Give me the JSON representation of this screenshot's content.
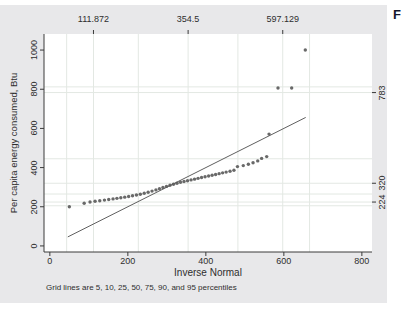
{
  "page": {
    "corner_text": "F"
  },
  "colors": {
    "background": "#e8e8ea",
    "plot_background": "#ffffff",
    "point": "#595959",
    "reference_line": "#5f5f5f",
    "grid": "#e3e8e3",
    "axis": "#3a3a3a",
    "text": "#2e2e2e"
  },
  "chart_data": {
    "type": "scatter",
    "title": "",
    "xlabel": "Inverse Normal",
    "ylabel": "Per capita energy consumed, Btu",
    "note": "Grid lines are 5, 10, 25, 50, 75, 90, and 95 percentiles",
    "xlim": [
      -15,
      826
    ],
    "ylim": [
      -31,
      1082
    ],
    "x_ticks": [
      0,
      200,
      400,
      600,
      800
    ],
    "y_ticks": [
      0,
      200,
      400,
      600,
      800,
      1000
    ],
    "top_axis_labels": [
      {
        "value": 111.872,
        "label": "111.872"
      },
      {
        "value": 354.5,
        "label": "354.5"
      },
      {
        "value": 597.129,
        "label": "597.129"
      }
    ],
    "right_axis_labels": [
      {
        "value": 783,
        "label": "783"
      },
      {
        "value": 320,
        "label": "320"
      },
      {
        "value": 224,
        "label": "224"
      }
    ],
    "grid_x_values": [
      43.1,
      111.872,
      226.8,
      354.5,
      482.2,
      597.129,
      665.9
    ],
    "grid_y_values": [
      205,
      224,
      265,
      320,
      445,
      783,
      812
    ],
    "reference_line": {
      "x1": 46,
      "y1": 46,
      "x2": 656,
      "y2": 656
    },
    "legend": "none",
    "grid": "percentile gridlines",
    "points": [
      [
        50,
        200
      ],
      [
        88,
        218
      ],
      [
        103,
        224
      ],
      [
        116,
        228
      ],
      [
        128,
        231
      ],
      [
        140,
        234
      ],
      [
        151,
        237
      ],
      [
        162,
        240
      ],
      [
        172,
        243
      ],
      [
        182,
        246
      ],
      [
        192,
        249
      ],
      [
        202,
        252
      ],
      [
        212,
        256
      ],
      [
        222,
        260
      ],
      [
        232,
        264
      ],
      [
        242,
        269
      ],
      [
        252,
        274
      ],
      [
        262,
        280
      ],
      [
        272,
        286
      ],
      [
        281,
        292
      ],
      [
        290,
        298
      ],
      [
        299,
        304
      ],
      [
        308,
        310
      ],
      [
        317,
        315
      ],
      [
        326,
        320
      ],
      [
        335,
        325
      ],
      [
        344,
        329
      ],
      [
        353,
        333
      ],
      [
        362,
        337
      ],
      [
        371,
        341
      ],
      [
        380,
        345
      ],
      [
        389,
        349
      ],
      [
        398,
        353
      ],
      [
        407,
        357
      ],
      [
        416,
        361
      ],
      [
        425,
        365
      ],
      [
        434,
        369
      ],
      [
        443,
        373
      ],
      [
        452,
        377
      ],
      [
        462,
        381
      ],
      [
        472,
        386
      ],
      [
        481,
        405
      ],
      [
        496,
        410
      ],
      [
        509,
        417
      ],
      [
        521,
        425
      ],
      [
        533,
        434
      ],
      [
        543,
        447
      ],
      [
        556,
        456
      ],
      [
        562,
        571
      ],
      [
        585,
        806
      ],
      [
        620,
        806
      ],
      [
        655,
        1000
      ]
    ]
  }
}
